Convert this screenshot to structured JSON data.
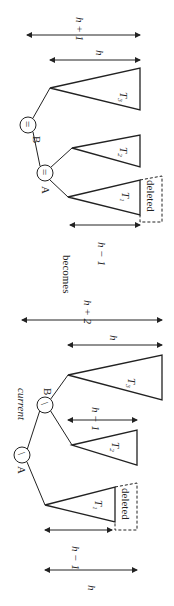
{
  "diagram": {
    "transition_label": "becomes",
    "before": {
      "pointer_label": "current",
      "nodes": [
        {
          "name": "A",
          "balance": "\\"
        },
        {
          "name": "B",
          "balance": "\\"
        }
      ],
      "subtrees": [
        {
          "name": "T",
          "sub": "1",
          "note": "deleted"
        },
        {
          "name": "T",
          "sub": "2"
        },
        {
          "name": "T",
          "sub": "3"
        }
      ],
      "heights": {
        "t1": "h − 1",
        "a_left_total": "h",
        "t2": "h − 1",
        "t3": "h",
        "total": "h + 2"
      }
    },
    "after": {
      "nodes": [
        {
          "name": "B",
          "balance": "="
        },
        {
          "name": "A",
          "balance": "="
        }
      ],
      "subtrees": [
        {
          "name": "T",
          "sub": "3"
        },
        {
          "name": "T",
          "sub": "2"
        },
        {
          "name": "T",
          "sub": "1",
          "note": "deleted"
        }
      ],
      "heights": {
        "total": "h + 1",
        "t3": "h",
        "t1": "h − 1"
      }
    }
  }
}
